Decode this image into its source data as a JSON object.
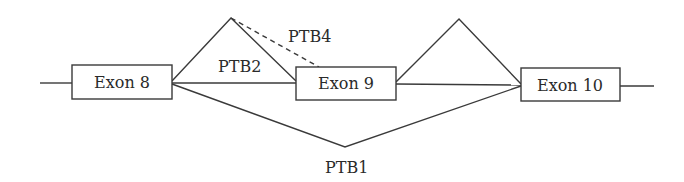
{
  "diagram": {
    "title": "",
    "exons": [
      {
        "label": "Exon 8"
      },
      {
        "label": "Exon 9"
      },
      {
        "label": "Exon 10"
      }
    ],
    "splice_labels": {
      "ptb4": "PTB4",
      "ptb2": "PTB2",
      "ptb1": "PTB1"
    },
    "colors": {
      "stroke": "#3a3a3a",
      "text": "#2a2a2a"
    }
  }
}
